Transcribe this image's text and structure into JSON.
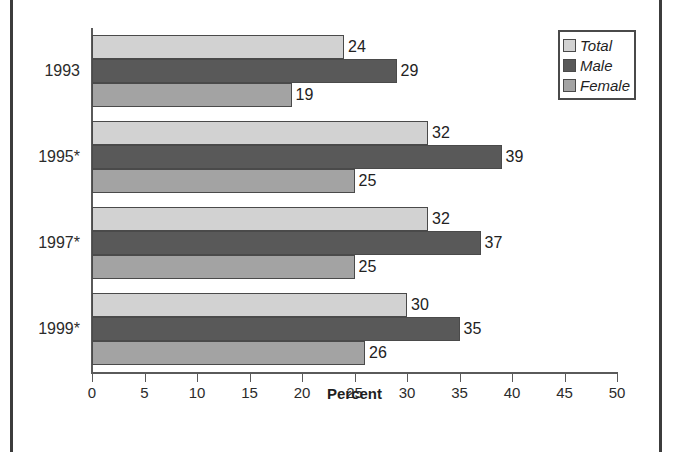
{
  "chart_data": {
    "type": "bar",
    "orientation": "horizontal",
    "title": "",
    "xlabel": "Percent",
    "ylabel": "",
    "xlim": [
      0,
      50
    ],
    "xticks": [
      0,
      5,
      10,
      15,
      20,
      25,
      30,
      35,
      40,
      45,
      50
    ],
    "xtick_labels": [
      "0",
      "5",
      "10",
      "15",
      "20",
      "25",
      "30",
      "35",
      "40",
      "45",
      "50"
    ],
    "grid": false,
    "legend_position": "top-right",
    "categories": [
      "1993",
      "1995*",
      "1997*",
      "1999*"
    ],
    "series": [
      {
        "name": "Total",
        "color": "#d2d2d2",
        "values": [
          24,
          32,
          32,
          30
        ]
      },
      {
        "name": "Male",
        "color": "#595959",
        "values": [
          29,
          39,
          37,
          35
        ]
      },
      {
        "name": "Female",
        "color": "#a3a3a3",
        "values": [
          19,
          25,
          25,
          26
        ]
      }
    ],
    "data_labels": [
      {
        "category": "1993",
        "Total": "24",
        "Male": "29",
        "Female": "19"
      },
      {
        "category": "1995*",
        "Total": "32",
        "Male": "39",
        "Female": "25"
      },
      {
        "category": "1997*",
        "Total": "32",
        "Male": "37",
        "Female": "25"
      },
      {
        "category": "1999*",
        "Total": "30",
        "Male": "35",
        "Female": "26"
      }
    ]
  },
  "legend": {
    "items": [
      {
        "label": "Total",
        "swatch": "total"
      },
      {
        "label": "Male",
        "swatch": "male"
      },
      {
        "label": "Female",
        "swatch": "female"
      }
    ]
  },
  "axis": {
    "x_title": "Percent"
  },
  "colors": {
    "total": "#d2d2d2",
    "male": "#595959",
    "female": "#a3a3a3",
    "axis": "#5a5a5a",
    "frame": "#3c3c3c",
    "text": "#2b2b2b"
  }
}
